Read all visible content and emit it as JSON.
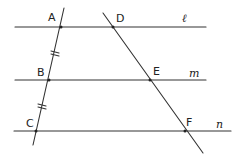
{
  "diagram": {
    "title": "",
    "parallel_lines": [
      {
        "name": "l",
        "y": 27,
        "x1": 15,
        "x2": 206,
        "label_pos": [
          182,
          22
        ]
      },
      {
        "name": "m",
        "y": 80,
        "x1": 15,
        "x2": 206,
        "label_pos": [
          190,
          77
        ]
      },
      {
        "name": "n",
        "y": 131,
        "x1": 14,
        "x2": 231,
        "label_pos": [
          216,
          128
        ]
      }
    ],
    "transversals": [
      {
        "name": "transversal-1",
        "x1": 64,
        "y1": 8,
        "x2": 33,
        "y2": 145
      },
      {
        "name": "transversal-2",
        "x1": 103,
        "y1": 13,
        "x2": 203,
        "y2": 153
      }
    ],
    "points": [
      {
        "name": "A",
        "x": 61,
        "y": 27,
        "label_pos": [
          48,
          21
        ]
      },
      {
        "name": "B",
        "x": 49,
        "y": 80,
        "label_pos": [
          37,
          75
        ]
      },
      {
        "name": "C",
        "x": 36,
        "y": 131,
        "label_pos": [
          26,
          127
        ]
      },
      {
        "name": "D",
        "x": 113,
        "y": 27,
        "label_pos": [
          116,
          22
        ]
      },
      {
        "name": "E",
        "x": 150,
        "y": 80,
        "label_pos": [
          153,
          75
        ]
      },
      {
        "name": "F",
        "x": 185,
        "y": 131,
        "label_pos": [
          186,
          126
        ]
      }
    ],
    "tick_marks": [
      {
        "segment": "AB",
        "x": 55,
        "y": 53
      },
      {
        "segment": "BC",
        "x": 42,
        "y": 106
      }
    ],
    "labels": {
      "A": "A",
      "B": "B",
      "C": "C",
      "D": "D",
      "E": "E",
      "F": "F",
      "l": "ℓ",
      "m": "m",
      "n": "n"
    }
  }
}
